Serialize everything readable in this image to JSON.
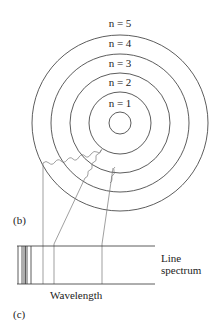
{
  "diagram": {
    "center": [
      120,
      123
    ],
    "nucleus_radius": 11,
    "orbits": [
      {
        "n": 1,
        "label": "n = 1",
        "radius": 34,
        "label_y": 104
      },
      {
        "n": 2,
        "label": "n = 2",
        "radius": 53,
        "label_y": 82
      },
      {
        "n": 3,
        "label": "n = 3",
        "radius": 72,
        "label_y": 63
      },
      {
        "n": 4,
        "label": "n = 4",
        "radius": 91,
        "label_y": 43
      },
      {
        "n": 5,
        "label": "n = 5",
        "radius": 110,
        "label_y": 24
      }
    ],
    "panel_labels": {
      "b": "(b)",
      "c": "(c)"
    },
    "spectrum": {
      "label_line1": "Line",
      "label_line2": "spectrum",
      "axis_label": "Wavelength"
    },
    "colors": {
      "line": "#333333",
      "photon": "#666666"
    }
  }
}
